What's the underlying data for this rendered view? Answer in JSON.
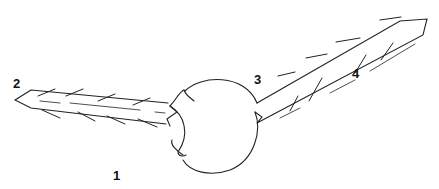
{
  "diagram": {
    "stroke_color": "#222222",
    "background": "#ffffff",
    "labels": [
      {
        "id": "1",
        "text": "1",
        "target": "sphere",
        "x": 118,
        "y": 178
      },
      {
        "id": "2",
        "text": "2",
        "target": "left-rod-tip",
        "x": 18,
        "y": 85
      },
      {
        "id": "3",
        "text": "3",
        "target": "right-rod-base",
        "x": 254,
        "y": 86
      },
      {
        "id": "4",
        "text": "4",
        "target": "right-rod-barbs",
        "x": 352,
        "y": 77
      }
    ]
  }
}
